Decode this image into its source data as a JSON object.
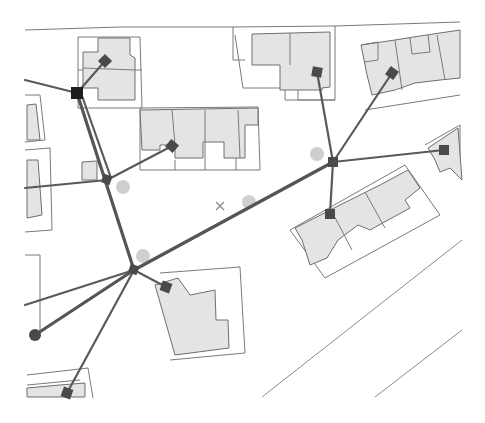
{
  "map": {
    "title": "Network service lines over building parcels",
    "colors": {
      "background": "#ffffff",
      "building_fill": "#e4e4e4",
      "outline": "#7a7a7a",
      "network_line": "#555555",
      "node": "#4a4a4a",
      "end_node": "#1e1e1e",
      "ghost_circle": "#cfcfcf"
    },
    "hubs": [
      {
        "id": "hub-a",
        "x": 107,
        "y": 180
      },
      {
        "id": "hub-b",
        "x": 134,
        "y": 270
      },
      {
        "id": "hub-c",
        "x": 333,
        "y": 162
      }
    ],
    "end_nodes": [
      {
        "id": "endpoint-top-left",
        "shape": "square",
        "x": 77,
        "y": 93
      },
      {
        "id": "endpoint-bottom-left",
        "shape": "circle",
        "x": 35,
        "y": 335
      }
    ],
    "service_nodes": [
      {
        "x": 105,
        "y": 61
      },
      {
        "x": 172,
        "y": 146
      },
      {
        "x": 317,
        "y": 72
      },
      {
        "x": 392,
        "y": 73
      },
      {
        "x": 444,
        "y": 150
      },
      {
        "x": 330,
        "y": 214
      },
      {
        "x": 166,
        "y": 287
      },
      {
        "x": 67,
        "y": 393
      }
    ],
    "ghost_circles": [
      {
        "x": 123,
        "y": 187
      },
      {
        "x": 249,
        "y": 202
      },
      {
        "x": 317,
        "y": 154
      },
      {
        "x": 143,
        "y": 256
      }
    ],
    "markers": [
      {
        "type": "x",
        "x": 220,
        "y": 206
      }
    ]
  }
}
